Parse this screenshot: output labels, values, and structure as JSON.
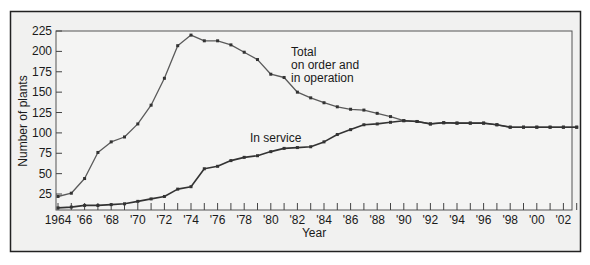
{
  "chart_data": {
    "type": "line",
    "title": "",
    "xlabel": "Year",
    "ylabel": "Number of plants",
    "ylim": [
      0,
      225
    ],
    "xlim": [
      1964,
      2003
    ],
    "grid": false,
    "legend": "inline labels",
    "y_ticks": [
      25,
      50,
      75,
      100,
      125,
      150,
      175,
      200,
      225
    ],
    "x_tick_labels": [
      {
        "year": 1964,
        "label": "1964"
      },
      {
        "year": 1966,
        "label": "'66"
      },
      {
        "year": 1968,
        "label": "'68"
      },
      {
        "year": 1970,
        "label": "'70"
      },
      {
        "year": 1972,
        "label": "'72"
      },
      {
        "year": 1974,
        "label": "'74"
      },
      {
        "year": 1976,
        "label": "'76"
      },
      {
        "year": 1978,
        "label": "'78"
      },
      {
        "year": 1980,
        "label": "'80"
      },
      {
        "year": 1982,
        "label": "'82"
      },
      {
        "year": 1984,
        "label": "'84"
      },
      {
        "year": 1986,
        "label": "'86"
      },
      {
        "year": 1988,
        "label": "'88"
      },
      {
        "year": 1990,
        "label": "'90"
      },
      {
        "year": 1992,
        "label": "'92"
      },
      {
        "year": 1994,
        "label": "'94"
      },
      {
        "year": 1996,
        "label": "'96"
      },
      {
        "year": 1998,
        "label": "'98"
      },
      {
        "year": 2000,
        "label": "'00"
      },
      {
        "year": 2002,
        "label": "'02"
      }
    ],
    "x": [
      1964,
      1965,
      1966,
      1967,
      1968,
      1969,
      1970,
      1971,
      1972,
      1973,
      1974,
      1975,
      1976,
      1977,
      1978,
      1979,
      1980,
      1981,
      1982,
      1983,
      1984,
      1985,
      1986,
      1987,
      1988,
      1989,
      1990,
      1991,
      1992,
      1993,
      1994,
      1995,
      1996,
      1997,
      1998,
      1999,
      2000,
      2001,
      2002,
      2003
    ],
    "series": [
      {
        "name": "Total on order and in operation",
        "label_lines": [
          "Total",
          "on order and",
          "in operation"
        ],
        "color": "#5a5a5a",
        "values": [
          22,
          26,
          44,
          76,
          89,
          95,
          111,
          134,
          167,
          207,
          220,
          213,
          213,
          208,
          199,
          190,
          172,
          168,
          150,
          143,
          137,
          132,
          129,
          128,
          124,
          120,
          115,
          114,
          111,
          112.5,
          112,
          112,
          112,
          110,
          107,
          107,
          107,
          107,
          107,
          107
        ]
      },
      {
        "name": "In service",
        "label_lines": [
          "In service"
        ],
        "color": "#333333",
        "values": [
          8,
          9,
          11,
          11,
          12,
          13,
          16,
          19,
          22,
          31,
          34,
          56,
          59,
          66,
          70,
          72,
          77,
          81,
          82,
          83,
          89,
          98,
          104,
          110,
          111,
          113,
          115,
          114,
          111,
          112.5,
          112,
          112,
          112,
          110,
          107,
          107,
          107,
          107,
          107,
          107
        ]
      }
    ]
  }
}
